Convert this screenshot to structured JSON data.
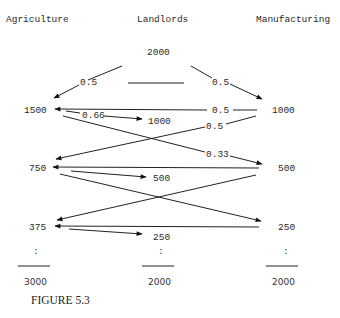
{
  "headers": {
    "agriculture": "Agriculture",
    "landlords": "Landlords",
    "manufacturing": "Manufacturing"
  },
  "landlords_initial": "2000",
  "flows": {
    "land_to_ag": "0.5",
    "land_to_mfg": "0.5",
    "mfg_to_ag_row1": "0.5",
    "ag_to_land": "0.66",
    "mfg_to_ag_cross": "0.5",
    "ag_to_mfg_cross": "0.33"
  },
  "rows": [
    {
      "agriculture": "1500",
      "landlords": "1000",
      "manufacturing": "1000"
    },
    {
      "agriculture": "750",
      "landlords": "500",
      "manufacturing": "500"
    },
    {
      "agriculture": "375",
      "landlords": "250",
      "manufacturing": "250"
    }
  ],
  "ellipsis": ":",
  "totals": {
    "agriculture": "3000",
    "landlords": "2000",
    "manufacturing": "2000"
  },
  "caption": "FIGURE 5.3"
}
